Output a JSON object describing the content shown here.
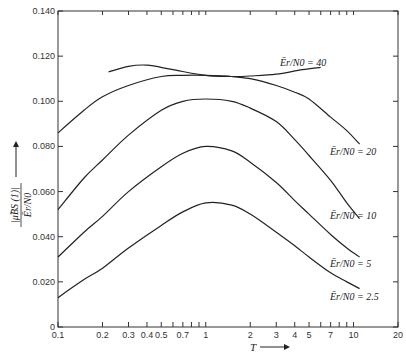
{
  "chart_data": {
    "type": "line",
    "title": "",
    "xlabel": "T",
    "ylabel": "|μ̃_BS(1)| / (Ē_r/N_0)",
    "xscale": "log",
    "xlim": [
      0.1,
      20
    ],
    "ylim": [
      0,
      0.14
    ],
    "grid": false,
    "x_ticks": [
      {
        "v": 0.1,
        "label": "0.1"
      },
      {
        "v": 0.2,
        "label": "0.2"
      },
      {
        "v": 0.3,
        "label": "0.3"
      },
      {
        "v": 0.4,
        "label": "0.4"
      },
      {
        "v": 0.5,
        "label": "0.5"
      },
      {
        "v": 0.6,
        "label": ""
      },
      {
        "v": 0.7,
        "label": "0.7"
      },
      {
        "v": 0.8,
        "label": ""
      },
      {
        "v": 0.9,
        "label": ""
      },
      {
        "v": 1,
        "label": "1"
      },
      {
        "v": 2,
        "label": "2"
      },
      {
        "v": 3,
        "label": "3"
      },
      {
        "v": 4,
        "label": "4"
      },
      {
        "v": 5,
        "label": "5"
      },
      {
        "v": 6,
        "label": ""
      },
      {
        "v": 7,
        "label": "7"
      },
      {
        "v": 8,
        "label": ""
      },
      {
        "v": 9,
        "label": ""
      },
      {
        "v": 10,
        "label": "10"
      },
      {
        "v": 20,
        "label": "20"
      }
    ],
    "y_ticks": [
      {
        "v": 0,
        "label": "0"
      },
      {
        "v": 0.02,
        "label": "0.020"
      },
      {
        "v": 0.04,
        "label": "0.040"
      },
      {
        "v": 0.06,
        "label": "0.060"
      },
      {
        "v": 0.08,
        "label": "0.080"
      },
      {
        "v": 0.1,
        "label": "0.100"
      },
      {
        "v": 0.12,
        "label": "0.120"
      },
      {
        "v": 0.14,
        "label": "0.140"
      }
    ],
    "series": [
      {
        "name": "Ē_r/N_0 = 40",
        "label_head": "Ē",
        "label_tail": "r/N0 = 40",
        "x": [
          0.22,
          0.3,
          0.4,
          0.6,
          1.0,
          1.5,
          2.0,
          3.0,
          4.5,
          6.0
        ],
        "y": [
          0.113,
          0.1155,
          0.116,
          0.114,
          0.1115,
          0.111,
          0.1112,
          0.112,
          0.114,
          0.115
        ],
        "label_pos": [
          280,
          66
        ]
      },
      {
        "name": "Ē_r/N_0 = 20",
        "x": [
          0.1,
          0.15,
          0.2,
          0.3,
          0.5,
          0.7,
          1.0,
          1.5,
          2.0,
          3.0,
          4.0,
          5.0,
          7.0,
          9.0,
          11.0
        ],
        "y": [
          0.086,
          0.096,
          0.102,
          0.107,
          0.111,
          0.1115,
          0.1115,
          0.111,
          0.11,
          0.107,
          0.104,
          0.101,
          0.093,
          0.087,
          0.081
        ],
        "label_pos": [
          330,
          155
        ]
      },
      {
        "name": "Ē_r/N_0 = 10",
        "x": [
          0.1,
          0.15,
          0.2,
          0.3,
          0.5,
          0.7,
          1.0,
          1.5,
          2.0,
          3.0,
          4.0,
          5.0,
          7.0,
          9.0,
          11.0
        ],
        "y": [
          0.052,
          0.066,
          0.074,
          0.085,
          0.096,
          0.1,
          0.101,
          0.1,
          0.097,
          0.091,
          0.083,
          0.076,
          0.065,
          0.055,
          0.048
        ],
        "label_pos": [
          330,
          219
        ]
      },
      {
        "name": "Ē_r/N_0 = 5",
        "x": [
          0.1,
          0.15,
          0.2,
          0.3,
          0.5,
          0.7,
          1.0,
          1.5,
          2.0,
          3.0,
          4.0,
          5.0,
          7.0,
          9.0,
          11.0
        ],
        "y": [
          0.031,
          0.042,
          0.049,
          0.06,
          0.071,
          0.077,
          0.08,
          0.078,
          0.073,
          0.064,
          0.056,
          0.05,
          0.041,
          0.035,
          0.031
        ],
        "label_pos": [
          330,
          267
        ]
      },
      {
        "name": "Ē_r/N_0 = 2.5",
        "x": [
          0.1,
          0.15,
          0.2,
          0.3,
          0.5,
          0.7,
          1.0,
          1.5,
          2.0,
          3.0,
          4.0,
          5.0,
          7.0,
          9.0,
          11.0
        ],
        "y": [
          0.013,
          0.021,
          0.026,
          0.035,
          0.045,
          0.051,
          0.055,
          0.054,
          0.05,
          0.042,
          0.036,
          0.031,
          0.024,
          0.02,
          0.017
        ],
        "label_pos": [
          330,
          300
        ]
      }
    ]
  },
  "labels": {
    "x_axis_title": "T",
    "y_axis_title_num": "|μ̃BS (1)|",
    "y_axis_title_den": "Ēr/N0",
    "series_labels": [
      "Ēr/N0 = 40",
      "Ēr/N0 = 20",
      "Ēr/N0 = 10",
      "Ēr/N0 = 5",
      "Ēr/N0 = 2.5"
    ]
  }
}
